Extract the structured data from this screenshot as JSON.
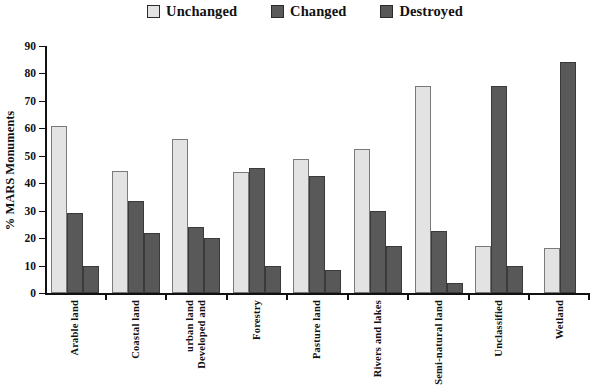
{
  "legend": {
    "items": [
      {
        "label": "Unchanged",
        "color": "#e3e3e3",
        "swatch_name": "legend-swatch-unchanged"
      },
      {
        "label": "Changed",
        "color": "#595959",
        "swatch_name": "legend-swatch-changed"
      },
      {
        "label": "Destroyed",
        "color": "#585858",
        "swatch_name": "legend-swatch-destroyed"
      }
    ]
  },
  "axes": {
    "ylabel": "% MARS Monuments",
    "yticks": [
      0,
      10,
      20,
      30,
      40,
      50,
      60,
      70,
      80,
      90
    ],
    "ymin": 0,
    "ymax": 90
  },
  "chart_data": {
    "type": "bar",
    "title": "",
    "xlabel": "",
    "ylabel": "% MARS Monuments",
    "ylim": [
      0,
      90
    ],
    "ytick_step": 10,
    "grid": false,
    "legend_position": "top-center",
    "categories": [
      "Arable land",
      "Coastal land",
      "Developed and urban land",
      "Forestry",
      "Pasture land",
      "Rivers and lakes",
      "Semi-natural land",
      "Unclassified",
      "Wetland"
    ],
    "category_lines": [
      [
        "Arable land"
      ],
      [
        "Coastal land"
      ],
      [
        "Developed and",
        "urban land"
      ],
      [
        "Forestry"
      ],
      [
        "Pasture land"
      ],
      [
        "Rivers and lakes"
      ],
      [
        "Semi-natural land"
      ],
      [
        "Unclassified"
      ],
      [
        "Wetland"
      ]
    ],
    "series": [
      {
        "name": "Unchanged",
        "color": "#e3e3e3",
        "values": [
          61,
          44.5,
          56,
          44,
          49,
          52.5,
          75.5,
          17,
          16.5
        ]
      },
      {
        "name": "Changed",
        "color": "#595959",
        "values": [
          29,
          33.5,
          24,
          45.5,
          42.5,
          30,
          22.5,
          75.5,
          84
        ]
      },
      {
        "name": "Destroyed",
        "color": "#585858",
        "values": [
          10,
          22,
          20,
          10,
          8.5,
          17,
          3.5,
          10,
          null
        ]
      }
    ]
  }
}
